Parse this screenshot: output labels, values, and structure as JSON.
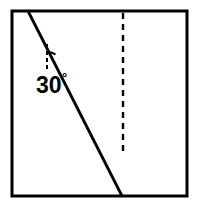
{
  "figure": {
    "background_color": "#ffffff",
    "ink_color": "#000000",
    "frame": {
      "x": 12,
      "y": 11,
      "width": 175,
      "height": 185,
      "stroke_width": 3,
      "stroke_color": "#000000",
      "fill_color": "#ffffff"
    },
    "hatched_region": {
      "name": "shaded-half-plane",
      "boundary_top_x": 28,
      "boundary_bottom_x": 122,
      "hatch_angle_from_vertical_deg": 30,
      "hatch_spacing_px": 9.5,
      "hatch_stroke_width": 2.6,
      "hatch_color": "#000000",
      "fill_color": "#ffffff"
    },
    "angle_annotation": {
      "label": "30",
      "degree_symbol": "°",
      "value": 30,
      "unit": "degrees",
      "vertex_x": 47,
      "vertex_y": 69,
      "reference_line": {
        "name": "dashed-vertical-reference",
        "x": 47,
        "y_top": 44,
        "y_bottom": 69,
        "dash_pattern": "4,3",
        "stroke_width": 2
      },
      "arc": {
        "radius": 17,
        "start_deg": -90,
        "end_deg": -60,
        "stroke_width": 2
      },
      "label_x": 36,
      "label_y": 93,
      "degree_x": 62,
      "degree_y": 82
    },
    "dashed_vertical_line": {
      "name": "interior-dashed-vertical",
      "x": 123,
      "y_top": 13,
      "y_bottom": 151,
      "dash_pattern": "6,5",
      "stroke_width": 2.4,
      "stroke_color": "#000000"
    }
  }
}
